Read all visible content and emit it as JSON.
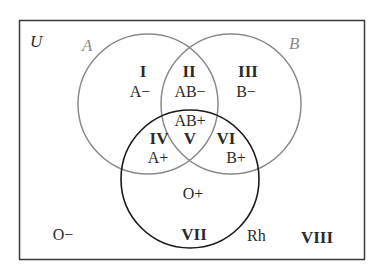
{
  "universe": {
    "label": "U"
  },
  "sets": {
    "A": {
      "label": "A",
      "stroke": "#8a8a8a"
    },
    "B": {
      "label": "B",
      "stroke": "#8a8a8a"
    },
    "Rh": {
      "label": "Rh",
      "stroke": "#1a1a1a"
    }
  },
  "regions": [
    {
      "numeral": "I",
      "type": "A−"
    },
    {
      "numeral": "II",
      "type": "AB−"
    },
    {
      "numeral": "III",
      "type": "B−"
    },
    {
      "numeral": "IV",
      "type": "A+"
    },
    {
      "numeral": "V",
      "type": "AB+"
    },
    {
      "numeral": "VI",
      "type": "B+"
    },
    {
      "numeral": "VII",
      "type": "O+"
    },
    {
      "numeral": "VIII",
      "type": "O−"
    }
  ],
  "colors": {
    "frame": "#3a3a3a",
    "text": "#2a2a2a",
    "set_label": "#8a8a8a"
  }
}
